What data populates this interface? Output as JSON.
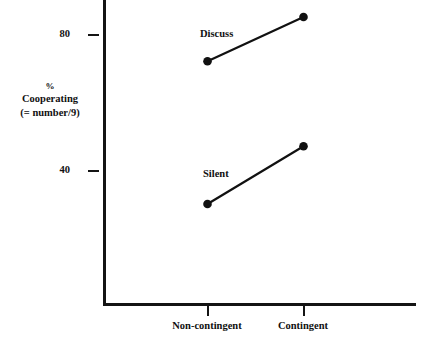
{
  "chart_data": {
    "type": "line",
    "title": "",
    "xlabel": "",
    "ylabel": "% Cooperating (= number/9)",
    "categories": [
      "Non-contingent",
      "Contingent"
    ],
    "ytick_labels": [
      "80",
      "40"
    ],
    "ytick_values": [
      80,
      40
    ],
    "ylim": [
      0,
      89
    ],
    "grid": false,
    "legend_position": "inline-labels",
    "series": [
      {
        "name": "Discuss",
        "values": [
          72,
          85
        ],
        "marker": "filled-circle",
        "color": "#111111"
      },
      {
        "name": "Silent",
        "values": [
          30,
          47
        ],
        "marker": "filled-circle",
        "color": "#111111"
      }
    ],
    "annotations": [
      {
        "text": "Discuss",
        "near_series": "Discuss"
      },
      {
        "text": "Silent",
        "near_series": "Silent"
      }
    ]
  },
  "axis": {
    "y_title_lines": [
      "%",
      "Cooperating",
      "(= number/9)"
    ],
    "y_title_line_pct": "%",
    "y_title_line_cooperating": "Cooperating",
    "y_title_line_number": "(= number/9)",
    "ytick_top_label": "80",
    "ytick_bottom_label": "40",
    "xtick_left_label": "Non-contingent",
    "xtick_right_label": "Contingent"
  },
  "series_labels": {
    "discuss": "Discuss",
    "silent": "Silent"
  },
  "colors": {
    "ink": "#141414",
    "text": "#111111",
    "background": "#ffffff"
  }
}
